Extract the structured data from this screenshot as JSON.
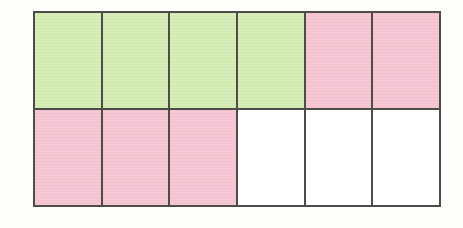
{
  "figure": {
    "name": "fraction-bar-grid",
    "type": "rectangle-partition-diagram",
    "columns": 6,
    "rows": 2,
    "total_cells": 12,
    "border_color": "#4c4c48",
    "background_color": "#fdfdfc",
    "fills": {
      "green": "#d6eeb6",
      "pink": "#f8c7d6",
      "white": "#ffffff"
    },
    "counts": {
      "green": 4,
      "pink": 5,
      "white": 3
    },
    "cells": [
      {
        "row": 1,
        "col": 1,
        "fill": "green",
        "label": ""
      },
      {
        "row": 1,
        "col": 2,
        "fill": "green",
        "label": ""
      },
      {
        "row": 1,
        "col": 3,
        "fill": "green",
        "label": ""
      },
      {
        "row": 1,
        "col": 4,
        "fill": "green",
        "label": ""
      },
      {
        "row": 1,
        "col": 5,
        "fill": "pink",
        "label": ""
      },
      {
        "row": 1,
        "col": 6,
        "fill": "pink",
        "label": ""
      },
      {
        "row": 2,
        "col": 1,
        "fill": "pink",
        "label": ""
      },
      {
        "row": 2,
        "col": 2,
        "fill": "pink",
        "label": ""
      },
      {
        "row": 2,
        "col": 3,
        "fill": "pink",
        "label": ""
      },
      {
        "row": 2,
        "col": 4,
        "fill": "white",
        "label": ""
      },
      {
        "row": 2,
        "col": 5,
        "fill": "white",
        "label": ""
      },
      {
        "row": 2,
        "col": 6,
        "fill": "white",
        "label": ""
      }
    ]
  }
}
